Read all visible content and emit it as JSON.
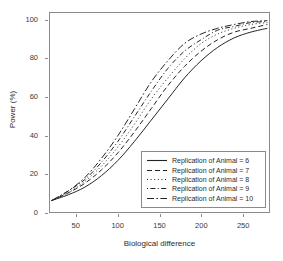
{
  "chart_data": {
    "type": "line",
    "title": "",
    "xlabel": "Biological difference",
    "ylabel": "Power (%)",
    "xlim": [
      18,
      282
    ],
    "ylim": [
      0,
      104
    ],
    "xticks": [
      50,
      100,
      150,
      200,
      250
    ],
    "xtick_labels": [
      "50",
      "100",
      "150",
      "200",
      "250"
    ],
    "yticks": [
      0,
      20,
      40,
      60,
      80,
      100
    ],
    "ytick_labels": [
      "0",
      "20",
      "40",
      "60",
      "80",
      "100"
    ],
    "grid": false,
    "legend_position": "bottom-right",
    "legend_title": "",
    "x": [
      20,
      40,
      60,
      80,
      100,
      120,
      140,
      160,
      180,
      200,
      220,
      240,
      260,
      280
    ],
    "series": [
      {
        "name": "Replication of  Animal =  6",
        "label": "Replication of  Animal =  6",
        "linestyle": "solid",
        "color": "#222222",
        "values": [
          6,
          9,
          13,
          19,
          27,
          37,
          48,
          59,
          70,
          79,
          86,
          91,
          94,
          96
        ]
      },
      {
        "name": "Replication of  Animal =  7",
        "label": "Replication of  Animal =  7",
        "linestyle": "dashed",
        "color": "#222222",
        "values": [
          6,
          10,
          15,
          22,
          31,
          42,
          54,
          66,
          76,
          84,
          90,
          94,
          96,
          98
        ]
      },
      {
        "name": "Replication of  Animal =  8",
        "label": "Replication of  Animal =  8",
        "linestyle": "dotted",
        "color": "#222222",
        "values": [
          6,
          10,
          16,
          24,
          34,
          46,
          59,
          70,
          80,
          88,
          93,
          96,
          98,
          99
        ]
      },
      {
        "name": "Replication of  Animal =  9",
        "label": "Replication of  Animal =  9",
        "linestyle": "dashdot",
        "color": "#222222",
        "values": [
          6,
          11,
          17,
          26,
          37,
          50,
          63,
          75,
          84,
          90,
          95,
          97,
          99,
          99.5
        ]
      },
      {
        "name": "Replication of  Animal =  10",
        "label": "Replication of  Animal =  10",
        "linestyle": "longdash-dot",
        "color": "#222222",
        "values": [
          6,
          11,
          18,
          28,
          40,
          54,
          68,
          79,
          88,
          93,
          96,
          98,
          99.5,
          100
        ]
      }
    ]
  },
  "axes": {
    "x_title": "Biological difference",
    "y_title": "Power (%)"
  },
  "legend": {
    "entries": [
      {
        "label": "Replication of  Animal =  6"
      },
      {
        "label": "Replication of  Animal =  7"
      },
      {
        "label": "Replication of  Animal =  8"
      },
      {
        "label": "Replication of  Animal =  9"
      },
      {
        "label": "Replication of  Animal =  10"
      }
    ]
  },
  "style": {
    "frame_color": "#8a8a8a",
    "line_color": "#222222",
    "background": "#ffffff"
  }
}
